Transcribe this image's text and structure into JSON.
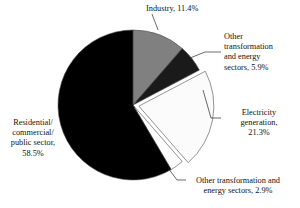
{
  "chart_data": {
    "type": "pie",
    "title": "",
    "subtitle": "",
    "xlabel": "",
    "ylabel": "",
    "legend_position": "none",
    "grid": false,
    "unit": "%",
    "total": 100.0,
    "categories": [
      "Industry",
      "Other transformation and energy sectors",
      "Electricity generation",
      "Other transformation and energy sectors",
      "Residential/commercial/public sector"
    ],
    "values": [
      11.4,
      5.9,
      21.3,
      2.9,
      58.5
    ],
    "colors": [
      "#808080",
      "#1a1a1a",
      "#fbfbfb",
      "#fdfdfd",
      "#000000"
    ],
    "slices": [
      {
        "name": "industry",
        "category": "Industry",
        "value": 11.4,
        "value_text": "11.4%",
        "label_text": "Industry, 11.4%",
        "color": "#808080",
        "exploded": false
      },
      {
        "name": "other-transformation-energy-5-9",
        "category": "Other transformation and energy sectors",
        "value": 5.9,
        "value_text": "5.9%",
        "label_text": "Other\ntransformation\nand energy\nsectors, 5.9%",
        "color": "#1a1a1a",
        "exploded": false
      },
      {
        "name": "electricity-generation",
        "category": "Electricity generation",
        "value": 21.3,
        "value_text": "21.3%",
        "label_text": "Electricity\ngeneration,\n21.3%",
        "color": "#fbfbfb",
        "exploded": true
      },
      {
        "name": "other-transformation-energy-2-9",
        "category": "Other transformation and energy sectors",
        "value": 2.9,
        "value_text": "2.9%",
        "label_text": "Other transformation and\nenergy sectors, 2.9%",
        "color": "#fdfdfd",
        "exploded": false
      },
      {
        "name": "residential-commercial-public",
        "category": "Residential/commercial/public sector",
        "value": 58.5,
        "value_text": "58.5%",
        "label_text": "Residential/\ncommercial/\npublic sector,\n58.5%",
        "color": "#000000",
        "exploded": false
      }
    ],
    "geometry": {
      "cx": 133,
      "cy": 105,
      "r": 75,
      "start_angle_deg": -90
    }
  }
}
